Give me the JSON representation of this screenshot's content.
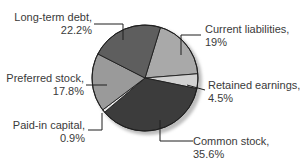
{
  "chart_data": {
    "type": "pie",
    "title": "",
    "start_angle_deg": 17,
    "direction": "clockwise",
    "slices": [
      {
        "label": "Current liabilities",
        "value": 19.0,
        "display": "19%",
        "color": "#a9a9a9"
      },
      {
        "label": "Retained earnings",
        "value": 4.5,
        "display": "4.5%",
        "color": "#d2d2d2"
      },
      {
        "label": "Common stock",
        "value": 35.6,
        "display": "35.6%",
        "color": "#3c3c3c"
      },
      {
        "label": "Paid-in capital",
        "value": 0.9,
        "display": "0.9%",
        "color": "#e6e6e6"
      },
      {
        "label": "Preferred stock",
        "value": 17.8,
        "display": "17.8%",
        "color": "#9a9a9a"
      },
      {
        "label": "Long-term debt",
        "value": 22.2,
        "display": "22.2%",
        "color": "#5e5e5e"
      }
    ]
  },
  "labels": {
    "long_term_debt": {
      "name": "Long-term debt,",
      "pct": "22.2%"
    },
    "current_liabilities": {
      "name": "Current liabilities,",
      "pct": "19%"
    },
    "retained_earnings": {
      "name": "Retained earnings,",
      "pct": "4.5%"
    },
    "preferred_stock": {
      "name": "Preferred stock,",
      "pct": "17.8%"
    },
    "paid_in_capital": {
      "name": "Paid-in capital,",
      "pct": "0.9%"
    },
    "common_stock": {
      "name": "Common stock,",
      "pct": "35.6%"
    }
  }
}
